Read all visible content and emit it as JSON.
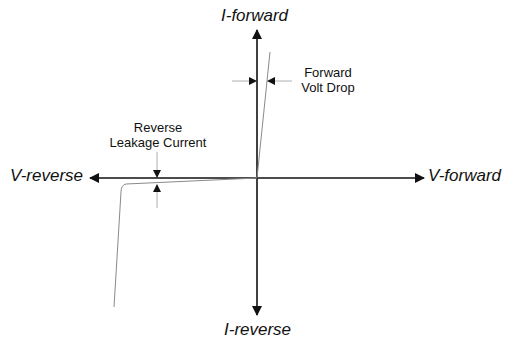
{
  "diagram": {
    "axes": {
      "y_positive": "I-forward",
      "y_negative": "I-reverse",
      "x_positive": "V-forward",
      "x_negative": "V-reverse"
    },
    "annotations": {
      "forward_volt_drop": [
        "Forward",
        "Volt Drop"
      ],
      "reverse_leakage": [
        "Reverse",
        "Leakage Current"
      ]
    },
    "colors": {
      "axis": "#111111",
      "curve": "#888888",
      "annotation": "#999999"
    }
  }
}
